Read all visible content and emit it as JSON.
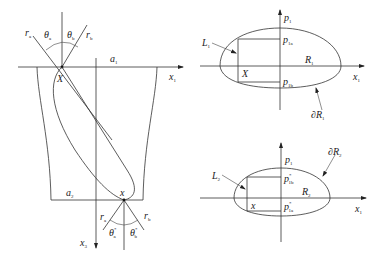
{
  "left_diagram": {
    "labels": {
      "r_a_top": "r",
      "r_a_top_sub": "a",
      "theta_a_top": "θ",
      "theta_a_top_sub": "a",
      "theta_b_top": "θ",
      "theta_b_top_sub": "b",
      "r_b_top": "r",
      "r_b_top_sub": "b",
      "a1": "a",
      "a1_sub": "1",
      "x1": "x",
      "x1_sub": "1",
      "X": "X",
      "a2": "a",
      "a2_sub": "2",
      "x_point": "x",
      "r_a_bot": "r",
      "r_a_bot_sub": "a",
      "r_b_bot": "r",
      "r_b_bot_sub": "b",
      "theta_a_bot": "θ",
      "theta_a_bot_sub": "a",
      "theta_a_bot_sup": "*",
      "theta_b_bot": "θ",
      "theta_b_bot_sub": "b",
      "theta_b_bot_sup": "*",
      "x3": "x",
      "x3_sub": "3"
    }
  },
  "top_right_diagram": {
    "labels": {
      "p1": "p",
      "p1_sub": "1",
      "L1": "L",
      "L1_sub": "1",
      "p1a": "p",
      "p1a_sub": "1a",
      "R1": "R",
      "R1_sub": "1",
      "X": "X",
      "x1": "x",
      "x1_sub": "1",
      "p1b": "p",
      "p1b_sub": "1b",
      "dR1": "∂R",
      "dR1_sub": "1"
    }
  },
  "bottom_right_diagram": {
    "labels": {
      "p1": "p",
      "p1_sub": "1",
      "dR2": "∂R",
      "dR2_sub": "2",
      "L2": "L",
      "L2_sub": "2",
      "p1b_star": "p",
      "p1b_star_sub": "1b",
      "p1b_star_sup": "*",
      "R2": "R",
      "R2_sub": "2",
      "x": "x",
      "x1": "x",
      "x1_sub": "1",
      "p1a_star": "p",
      "p1a_star_sub": "1a",
      "p1a_star_sup": "*"
    }
  }
}
